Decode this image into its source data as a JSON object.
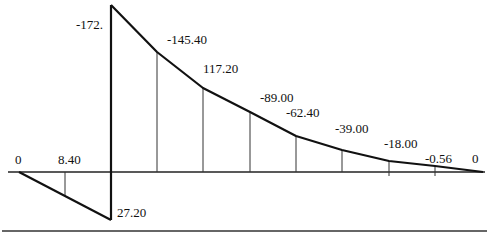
{
  "diagram": {
    "type": "shear-force-diagram",
    "baseline_start_label": "0",
    "baseline_end_label": "0",
    "labels": [
      {
        "id": "start",
        "text": "0"
      },
      {
        "id": "neg-mid",
        "text": "8.40"
      },
      {
        "id": "neg-peak",
        "text": "27.20"
      },
      {
        "id": "pos-peak",
        "text": "-172."
      },
      {
        "id": "v1",
        "text": "-145.40"
      },
      {
        "id": "v2",
        "text": "117.20"
      },
      {
        "id": "v3",
        "text": "-89.00"
      },
      {
        "id": "v4",
        "text": "-62.40"
      },
      {
        "id": "v5",
        "text": "-39.00"
      },
      {
        "id": "v6",
        "text": "-18.00"
      },
      {
        "id": "v7",
        "text": "-0.56"
      },
      {
        "id": "end",
        "text": "0"
      }
    ],
    "values_in_order": [
      0,
      8.4,
      27.2,
      -172,
      -145.4,
      117.2,
      -89.0,
      -62.4,
      -39.0,
      -18.0,
      -0.56,
      0
    ],
    "line_color": "#111111"
  }
}
